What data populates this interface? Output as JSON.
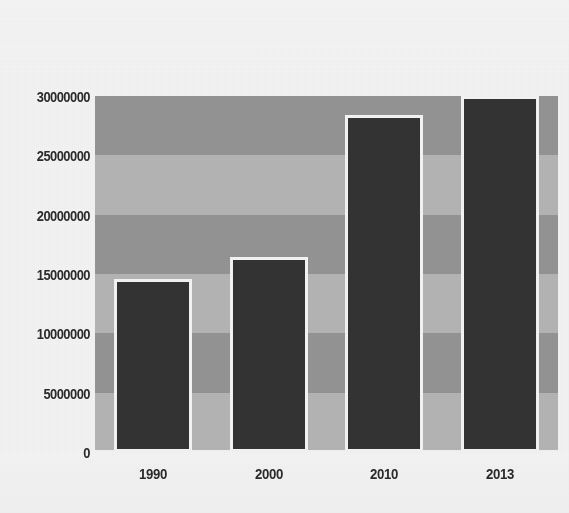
{
  "chart_data": {
    "type": "bar",
    "title": "",
    "subtitle": "",
    "xlabel": "",
    "ylabel": "",
    "categories": [
      "1990",
      "2000",
      "2010",
      "2013"
    ],
    "values": [
      14600000,
      16400000,
      28400000,
      30000000
    ],
    "series": [
      {
        "name": "",
        "values": [
          14600000,
          16400000,
          28400000,
          30000000
        ]
      }
    ],
    "ylim": [
      0,
      30000000
    ],
    "ytick_labels": [
      "0",
      "5000000",
      "10000000",
      "15000000",
      "20000000",
      "25000000",
      "30000000"
    ],
    "ytick_values": [
      0,
      5000000,
      10000000,
      15000000,
      20000000,
      25000000,
      30000000
    ],
    "xtick_labels": [
      "1990",
      "2000",
      "2010",
      "2013"
    ],
    "grid": false,
    "banded_background": true,
    "legend": null,
    "legend_position": "none",
    "annotations": []
  },
  "style": {
    "bar_fill": "#333333",
    "bar_border": "#f4f4f4",
    "band_light": "#b4b4b4",
    "band_dark": "#949494",
    "plot_background": "#b4b4b4",
    "figure_background": "#f3f3f3",
    "tick_label_color": "#2b2b2b"
  }
}
